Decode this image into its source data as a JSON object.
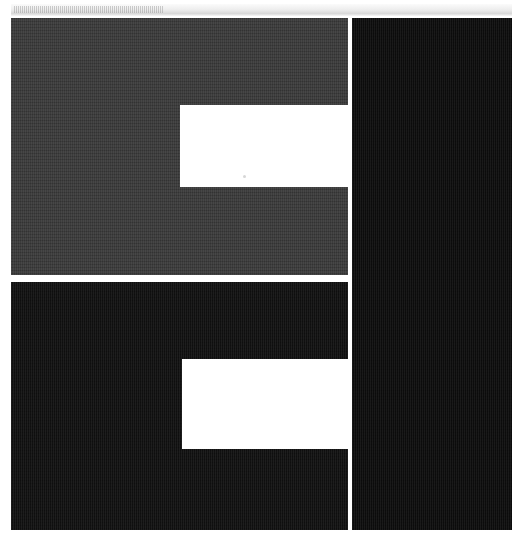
{
  "screen": {
    "width": 526,
    "height": 545,
    "background_color": "#ffffff",
    "description": "Blank dark-themed application window with empty white content cards"
  },
  "title_bar": {
    "name": "title-strip",
    "label": "",
    "background_color": "#eeeeee",
    "height_px": 12,
    "texture": "fine-vertical-hatch"
  },
  "panels": [
    {
      "id": "upper-left",
      "label": "",
      "role": "primary-content-panel",
      "color": "#3c3c3c",
      "x": 11,
      "y": 18,
      "width": 337,
      "height": 257
    },
    {
      "id": "right",
      "label": "",
      "role": "side-panel",
      "color": "#0d0d0d",
      "x": 352,
      "y": 18,
      "width": 160,
      "height": 512
    },
    {
      "id": "lower-left",
      "label": "",
      "role": "secondary-content-panel",
      "color": "#111111",
      "x": 11,
      "y": 282,
      "width": 337,
      "height": 248
    }
  ],
  "content_cards": [
    {
      "id": "upper",
      "label": "",
      "color": "#ffffff",
      "x": 180,
      "y": 105,
      "width": 168,
      "height": 82,
      "state": "empty"
    },
    {
      "id": "lower",
      "label": "",
      "color": "#ffffff",
      "x": 182,
      "y": 359,
      "width": 166,
      "height": 90,
      "state": "empty"
    }
  ],
  "dividers": [
    {
      "id": "horizontal-gap",
      "orientation": "horizontal",
      "color": "#ffffff",
      "y": 275,
      "thickness": 7
    },
    {
      "id": "vertical-gap",
      "orientation": "vertical",
      "color": "#ffffff",
      "x": 348,
      "thickness": 4
    }
  ],
  "colors": {
    "page_background": "#ffffff",
    "panel_gray": "#3c3c3c",
    "panel_black": "#0d0d0d",
    "panel_black_alt": "#111111",
    "card_white": "#ffffff",
    "title_strip": "#eeeeee"
  }
}
